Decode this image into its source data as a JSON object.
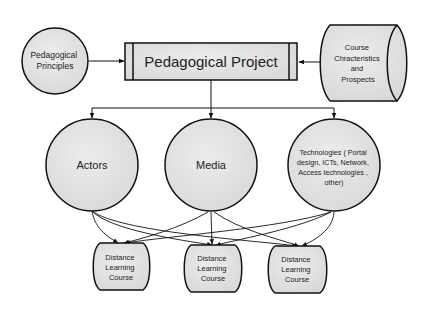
{
  "diagram": {
    "colors": {
      "node_fill": "#e4e4e4",
      "stroke": "#111111",
      "text": "#222222",
      "background": "#ffffff"
    },
    "nodes": {
      "principles": {
        "label_lines": [
          "Pedagogical",
          "Principles"
        ],
        "shape": "circle"
      },
      "project": {
        "label": "Pedagogical Project",
        "shape": "predefined-process"
      },
      "course": {
        "label_lines": [
          "Course",
          "Chracteristics",
          "and",
          "Prospects"
        ],
        "shape": "cylinder"
      },
      "actors": {
        "label": "Actors",
        "shape": "circle"
      },
      "media": {
        "label": "Media",
        "shape": "circle"
      },
      "technologies": {
        "label_lines": [
          "Technologies ( Portal",
          "design, ICTs, Network,",
          "Access technologies ,",
          "other)"
        ],
        "shape": "circle"
      },
      "dl_courses": [
        {
          "label_lines": [
            "Distance",
            "Learning",
            "Course"
          ]
        },
        {
          "label_lines": [
            "Distance",
            "Learning",
            "Course"
          ]
        },
        {
          "label_lines": [
            "Distance",
            "Learning",
            "Course"
          ]
        }
      ]
    },
    "edges": [
      {
        "from": "Pedagogical Principles",
        "to": "Pedagogical Project"
      },
      {
        "from": "Course Chracteristics and Prospects",
        "to": "Pedagogical Project"
      },
      {
        "from": "Pedagogical Project",
        "to": "Actors"
      },
      {
        "from": "Pedagogical Project",
        "to": "Media"
      },
      {
        "from": "Pedagogical Project",
        "to": "Technologies"
      },
      {
        "from": "Actors",
        "to": "Distance Learning Course 1"
      },
      {
        "from": "Actors",
        "to": "Distance Learning Course 2"
      },
      {
        "from": "Actors",
        "to": "Distance Learning Course 3"
      },
      {
        "from": "Media",
        "to": "Distance Learning Course 1"
      },
      {
        "from": "Media",
        "to": "Distance Learning Course 2"
      },
      {
        "from": "Media",
        "to": "Distance Learning Course 3"
      },
      {
        "from": "Technologies",
        "to": "Distance Learning Course 1"
      },
      {
        "from": "Technologies",
        "to": "Distance Learning Course 2"
      },
      {
        "from": "Technologies",
        "to": "Distance Learning Course 3"
      }
    ]
  }
}
